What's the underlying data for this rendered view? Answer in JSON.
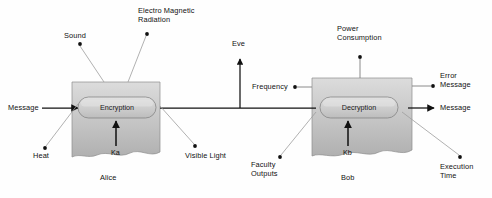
{
  "diagram": {
    "colors": {
      "box_fill_light": "#d8d8d8",
      "box_fill_dark": "#b9b9b9",
      "capsule_fill": "#cfcfcf",
      "stroke": "#555555",
      "thin_leader": "#aaaaaa",
      "text": "#111111",
      "background": "#ffffff"
    },
    "actors": [
      {
        "id": "alice",
        "name": "Alice",
        "process": "Encryption",
        "key": "Ka"
      },
      {
        "id": "bob",
        "name": "Bob",
        "process": "Decryption",
        "key": "Kb"
      }
    ],
    "io": {
      "input_message": "Message",
      "output_message": "Message",
      "eavesdropper": "Eve"
    },
    "alice_leaks": [
      {
        "id": "sound",
        "label": "Sound"
      },
      {
        "id": "emr",
        "label": "Electro Magnetic\nRadiation"
      },
      {
        "id": "heat",
        "label": "Heat"
      },
      {
        "id": "visible-light",
        "label": "Visible Light"
      }
    ],
    "bob_leaks": [
      {
        "id": "power-consumption",
        "label": "Power\nConsumption"
      },
      {
        "id": "frequency",
        "label": "Frequency"
      },
      {
        "id": "error-message",
        "label": "Error\nMessage"
      },
      {
        "id": "faculty-outputs",
        "label": "Faculty\nOutputs"
      },
      {
        "id": "execution-time",
        "label": "Execution\nTime"
      }
    ]
  }
}
